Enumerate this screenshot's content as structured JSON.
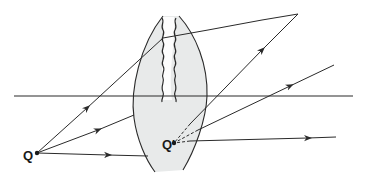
{
  "diagram": {
    "colors": {
      "stroke": "#2a2a2a",
      "lens_fill": "#e8eaea",
      "background": "#ffffff"
    },
    "labels": {
      "object_point": "Q",
      "image_point": "Q'"
    },
    "optical_axis": {
      "x1": 14,
      "y": 96,
      "x2": 353
    },
    "object": {
      "x": 37,
      "y": 153
    },
    "image": {
      "x": 174,
      "y": 143
    },
    "rays": [
      {
        "name": "upper-ray",
        "incident_to": [
          163,
          38
        ],
        "exit_to": [
          298,
          14
        ]
      },
      {
        "name": "middle-ray",
        "incident_to": [
          134,
          115
        ],
        "exit_to": [
          334,
          65
        ]
      },
      {
        "name": "lower-ray",
        "incident_to": [
          148,
          156
        ],
        "exit_to": [
          336,
          137
        ]
      }
    ]
  }
}
